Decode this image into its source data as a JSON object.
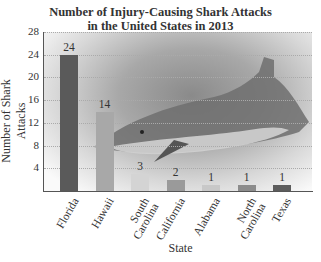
{
  "chart_data": {
    "type": "bar",
    "title_lines": [
      "Number of Injury-Causing Shark Attacks",
      "in the United States in 2013"
    ],
    "xlabel": "State",
    "ylabel": "Number of Shark Attacks",
    "categories": [
      "Florida",
      "Hawaii",
      "South Carolina",
      "California",
      "Alabama",
      "North Carolina",
      "Texas"
    ],
    "category_labels": [
      "Florida",
      "Hawaii",
      "South\nCarolina",
      "California",
      "Alabama",
      "North\nCarolina",
      "Texas"
    ],
    "values": [
      24,
      14,
      3,
      2,
      1,
      1,
      1
    ],
    "value_labels": [
      "24",
      "14",
      "3",
      "2",
      "1",
      "1",
      "1"
    ],
    "bar_colors": [
      "#5a5a5a",
      "#a8a8a8",
      "#d4d4d4",
      "#9a9a9a",
      "#c8c8c8",
      "#8c8c8c",
      "#5c5c5c"
    ],
    "ylim": [
      0,
      28
    ],
    "yticks": [
      4,
      8,
      12,
      16,
      20,
      24,
      28
    ],
    "ytick_labels": [
      "4",
      "8",
      "12",
      "16",
      "20",
      "24",
      "28"
    ],
    "grid": true,
    "legend": null,
    "background_image": "shark-photo"
  }
}
